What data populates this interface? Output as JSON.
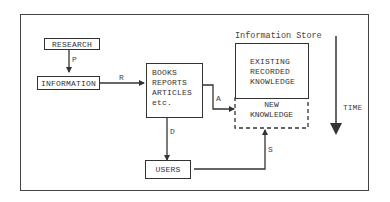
{
  "diagram": {
    "title": "Information Store",
    "nodes": {
      "research": "RESEARCH",
      "information": "INFORMATION",
      "publications": [
        "BOOKS",
        "REPORTS",
        "ARTICLES",
        "etc."
      ],
      "users": "USERS",
      "existing": [
        "EXISTING",
        "RECORDED",
        "KNOWLEDGE"
      ],
      "new_knowledge": [
        "NEW",
        "KNOWLEDGE"
      ]
    },
    "edges": {
      "p": "P",
      "r": "R",
      "a": "A",
      "d": "D",
      "s": "S"
    },
    "time_label": "TIME"
  }
}
